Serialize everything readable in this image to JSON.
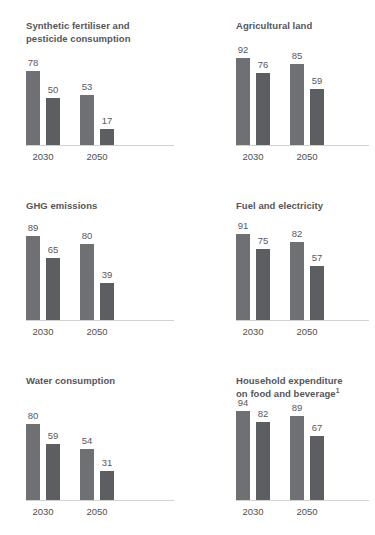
{
  "chart_data": [
    {
      "type": "bar",
      "title": "Synthetic fertiliser and pesticide consumption",
      "title_lines": [
        "Synthetic fertiliser and",
        "pesticide consumption"
      ],
      "footnote_marker": "",
      "categories": [
        "2030",
        "2050"
      ],
      "series": [
        {
          "name": "scenario-1",
          "values": [
            78,
            53
          ]
        },
        {
          "name": "scenario-2",
          "values": [
            50,
            17
          ]
        }
      ],
      "xlabel": "",
      "ylabel": "",
      "ylim": [
        0,
        100
      ],
      "grid": false,
      "legend": "none"
    },
    {
      "type": "bar",
      "title": "Agricultural land",
      "title_lines": [
        "Agricultural land"
      ],
      "footnote_marker": "",
      "categories": [
        "2030",
        "2050"
      ],
      "series": [
        {
          "name": "scenario-1",
          "values": [
            92,
            85
          ]
        },
        {
          "name": "scenario-2",
          "values": [
            76,
            59
          ]
        }
      ],
      "xlabel": "",
      "ylabel": "",
      "ylim": [
        0,
        100
      ],
      "grid": false,
      "legend": "none"
    },
    {
      "type": "bar",
      "title": "GHG emissions",
      "title_lines": [
        "GHG emissions"
      ],
      "footnote_marker": "",
      "categories": [
        "2030",
        "2050"
      ],
      "series": [
        {
          "name": "scenario-1",
          "values": [
            89,
            80
          ]
        },
        {
          "name": "scenario-2",
          "values": [
            65,
            39
          ]
        }
      ],
      "xlabel": "",
      "ylabel": "",
      "ylim": [
        0,
        100
      ],
      "grid": false,
      "legend": "none"
    },
    {
      "type": "bar",
      "title": "Fuel and electricity",
      "title_lines": [
        "Fuel and electricity"
      ],
      "footnote_marker": "",
      "categories": [
        "2030",
        "2050"
      ],
      "series": [
        {
          "name": "scenario-1",
          "values": [
            91,
            82
          ]
        },
        {
          "name": "scenario-2",
          "values": [
            75,
            57
          ]
        }
      ],
      "xlabel": "",
      "ylabel": "",
      "ylim": [
        0,
        100
      ],
      "grid": false,
      "legend": "none"
    },
    {
      "type": "bar",
      "title": "Water consumption",
      "title_lines": [
        "Water consumption"
      ],
      "footnote_marker": "",
      "categories": [
        "2030",
        "2050"
      ],
      "series": [
        {
          "name": "scenario-1",
          "values": [
            80,
            54
          ]
        },
        {
          "name": "scenario-2",
          "values": [
            59,
            31
          ]
        }
      ],
      "xlabel": "",
      "ylabel": "",
      "ylim": [
        0,
        100
      ],
      "grid": false,
      "legend": "none"
    },
    {
      "type": "bar",
      "title": "Household expenditure on food and beverage",
      "title_lines": [
        "Household expenditure",
        "on food and beverage"
      ],
      "footnote_marker": "1",
      "categories": [
        "2030",
        "2050"
      ],
      "series": [
        {
          "name": "scenario-1",
          "values": [
            94,
            89
          ]
        },
        {
          "name": "scenario-2",
          "values": [
            82,
            67
          ]
        }
      ],
      "xlabel": "",
      "ylabel": "",
      "ylim": [
        0,
        100
      ],
      "grid": false,
      "legend": "none"
    }
  ],
  "style": {
    "bar_color_series1": "#6f7073",
    "bar_color_series2": "#5d5e61",
    "title_color": "#55565a",
    "label_color": "#58595c",
    "axis_line_color": "#d2d2d2",
    "background": "#ffffff"
  }
}
